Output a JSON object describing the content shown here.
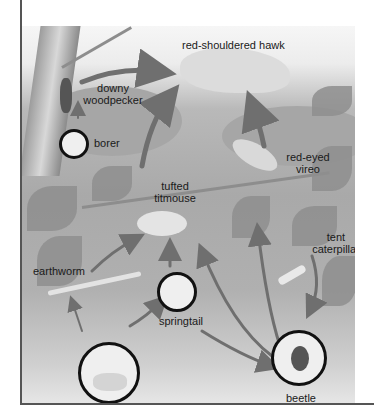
{
  "organisms": {
    "hawk": "red-shouldered hawk",
    "woodpecker_line1": "downy",
    "woodpecker_line2": "woodpecker",
    "borer": "borer",
    "titmouse_line1": "tufted",
    "titmouse_line2": "titmouse",
    "vireo_line1": "red-eyed",
    "vireo_line2": "vireo",
    "caterpillar_line1": "tent",
    "caterpillar_line2": "caterpillar",
    "earthworm": "earthworm",
    "springtail": "springtail",
    "beetle": "beetle",
    "soil": "soil bacteria, fungi"
  },
  "colors": {
    "arrow": "#6f6f6f",
    "border": "#555555",
    "circle_outline": "#111111"
  },
  "relationships": [
    {
      "from": "downy woodpecker",
      "to": "red-shouldered hawk"
    },
    {
      "from": "tufted titmouse",
      "to": "red-shouldered hawk"
    },
    {
      "from": "red-eyed vireo",
      "to": "red-shouldered hawk"
    },
    {
      "from": "borer",
      "to": "downy woodpecker"
    },
    {
      "from": "earthworm",
      "to": "tufted titmouse"
    },
    {
      "from": "springtail",
      "to": "tufted titmouse"
    },
    {
      "from": "beetle",
      "to": "tufted titmouse"
    },
    {
      "from": "beetle",
      "to": "red-eyed vireo"
    },
    {
      "from": "tent caterpillar",
      "to": "beetle"
    },
    {
      "from": "soil bacteria, fungi",
      "to": "earthworm"
    },
    {
      "from": "soil bacteria, fungi",
      "to": "springtail"
    },
    {
      "from": "springtail",
      "to": "beetle"
    }
  ]
}
